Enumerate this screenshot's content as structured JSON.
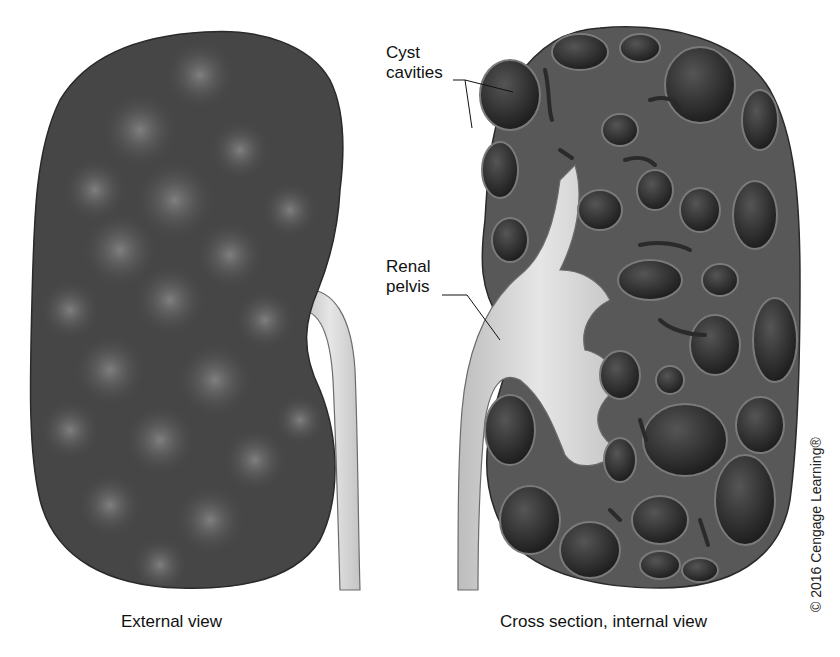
{
  "figure": {
    "panels": [
      {
        "id": "external",
        "caption": "External view"
      },
      {
        "id": "internal",
        "caption": "Cross section, internal view"
      }
    ],
    "labels": {
      "cyst_line1": "Cyst",
      "cyst_line2": "cavities",
      "pelvis_line1": "Renal",
      "pelvis_line2": "pelvis"
    },
    "copyright": "© 2016 Cengage Learning®",
    "colors": {
      "kidney_dark": "#3a3a3a",
      "kidney_mid": "#5a5a5a",
      "cyst_fill": "#2b2b2b",
      "pelvis_fill": "#d9d9d9",
      "background": "#ffffff"
    }
  }
}
